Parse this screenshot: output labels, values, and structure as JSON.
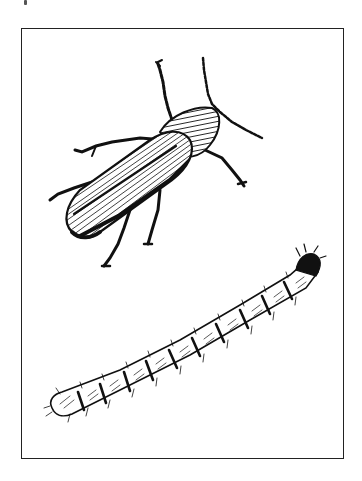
{
  "illustration": {
    "subjects": [
      {
        "name": "adult-beetle",
        "position": "upper-center"
      },
      {
        "name": "larva",
        "position": "lower-diagonal"
      }
    ],
    "frame": {
      "color": "#222222"
    },
    "ink_color": "#111111",
    "background": "#ffffff"
  }
}
